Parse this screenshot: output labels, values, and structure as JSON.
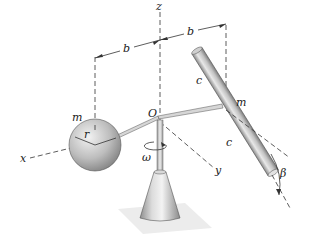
{
  "figure": {
    "type": "3D dynamics diagram",
    "labels": {
      "z_axis": "z",
      "x_axis": "x",
      "y_axis": "y",
      "origin": "O",
      "left_dim": "b",
      "right_dim": "b",
      "sphere_mass": "m",
      "sphere_radius": "r",
      "rod_mass": "m",
      "rod_upper_half": "c",
      "rod_lower_half": "c",
      "angular_velocity": "ω",
      "tilt_angle": "β"
    },
    "colors": {
      "line": "#333333",
      "metal_light": "#e6e6e6",
      "metal_mid": "#b5b5b5",
      "metal_dark": "#7d7d7d",
      "shadow": "#e9e9e9"
    }
  }
}
